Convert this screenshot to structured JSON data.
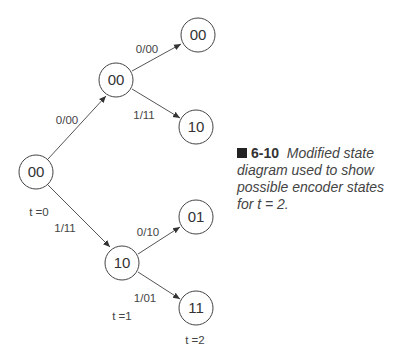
{
  "diagram": {
    "nodes": [
      {
        "id": "root",
        "label": "00",
        "cx": 36,
        "cy": 172
      },
      {
        "id": "t1-top",
        "label": "00",
        "cx": 116,
        "cy": 80
      },
      {
        "id": "t1-bottom",
        "label": "10",
        "cx": 122,
        "cy": 263
      },
      {
        "id": "t2-a",
        "label": "00",
        "cx": 198,
        "cy": 35
      },
      {
        "id": "t2-b",
        "label": "10",
        "cx": 196,
        "cy": 127
      },
      {
        "id": "t2-c",
        "label": "01",
        "cx": 196,
        "cy": 217
      },
      {
        "id": "t2-d",
        "label": "11",
        "cx": 196,
        "cy": 308
      }
    ],
    "edges": [
      {
        "from": "root",
        "to": "t1-top",
        "label": "0/00"
      },
      {
        "from": "root",
        "to": "t1-bottom",
        "label": "1/11"
      },
      {
        "from": "t1-top",
        "to": "t2-a",
        "label": "0/00"
      },
      {
        "from": "t1-top",
        "to": "t2-b",
        "label": "1/11"
      },
      {
        "from": "t1-bottom",
        "to": "t2-c",
        "label": "0/10"
      },
      {
        "from": "t1-bottom",
        "to": "t2-d",
        "label": "1/01"
      }
    ],
    "time_labels": {
      "t0": "t =0",
      "t1": "t =1",
      "t2": "t =2"
    }
  },
  "caption": {
    "number": "6-10",
    "text": "Modified state diagram used to show possible encoder states for t = 2."
  }
}
